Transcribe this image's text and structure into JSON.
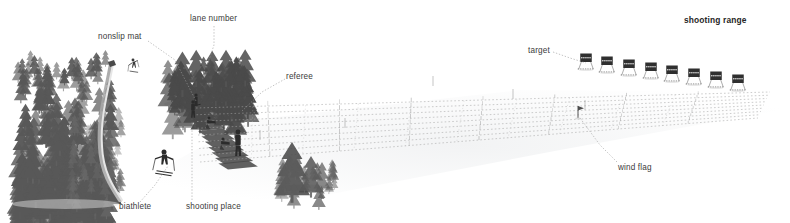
{
  "figure": {
    "domain": "diagram",
    "background_color": "#ffffff",
    "ink_color": "#3b3b3b",
    "title": "shooting range"
  },
  "labels": [
    {
      "id": "lane-number",
      "text": "lane number",
      "x": 190,
      "y": 15,
      "bold": false,
      "leader": [
        [
          214,
          26
        ],
        [
          214,
          45
        ],
        [
          208,
          63
        ]
      ]
    },
    {
      "id": "nonslip-mat",
      "text": "nonslip mat",
      "x": 98,
      "y": 33,
      "bold": false,
      "leader": [
        [
          148,
          41
        ],
        [
          175,
          60
        ],
        [
          196,
          101
        ]
      ]
    },
    {
      "id": "referee",
      "text": "referee",
      "x": 286,
      "y": 73,
      "bold": false,
      "leader": [
        [
          285,
          79
        ],
        [
          262,
          92
        ],
        [
          241,
          112
        ]
      ]
    },
    {
      "id": "target",
      "text": "target",
      "x": 528,
      "y": 47,
      "bold": false,
      "leader": [
        [
          553,
          52
        ],
        [
          570,
          58
        ],
        [
          586,
          63
        ]
      ]
    },
    {
      "id": "shooting-range",
      "text": "shooting range",
      "x": 684,
      "y": 16,
      "bold": true,
      "leader": []
    },
    {
      "id": "wind-flag",
      "text": "wind flag",
      "x": 618,
      "y": 164,
      "bold": false,
      "leader": [
        [
          617,
          162
        ],
        [
          600,
          145
        ],
        [
          580,
          118
        ]
      ]
    },
    {
      "id": "biathlete",
      "text": "biathlete",
      "x": 119,
      "y": 203,
      "bold": false,
      "leader": [
        [
          140,
          202
        ],
        [
          155,
          185
        ],
        [
          168,
          166
        ]
      ]
    },
    {
      "id": "shooting-place",
      "text": "shooting place",
      "x": 186,
      "y": 203,
      "bold": false,
      "leader": [
        [
          192,
          200
        ],
        [
          192,
          160
        ],
        [
          192,
          130
        ]
      ]
    }
  ],
  "scene_elements": {
    "forest_left": {
      "name": "dense conifer forest",
      "x": 18,
      "y": 50,
      "width": 95,
      "height": 150
    },
    "ski_track": {
      "name": "curving ski track",
      "from": [
        111,
        63
      ],
      "to": [
        122,
        200
      ]
    },
    "tree_cluster_center": {
      "name": "tree cluster behind shooting place",
      "x": 168,
      "y": 48,
      "width": 82,
      "height": 55
    },
    "spruce_cluster_front": {
      "name": "small spruce cluster",
      "x": 278,
      "y": 140,
      "width": 58,
      "height": 50
    },
    "skier_upper": {
      "name": "skier on track",
      "x": 133,
      "y": 60
    },
    "biathlete_front": {
      "name": "skiing biathlete",
      "x": 162,
      "y": 150
    },
    "referee_figure": {
      "name": "standing referee",
      "x": 237,
      "y": 133
    },
    "mat_count": 12,
    "lane_count": 8,
    "target_count": 8,
    "wind_flag_post": {
      "x": 578,
      "y": 118
    }
  },
  "targets": [
    {
      "n": 1,
      "x": 586,
      "y": 62
    },
    {
      "n": 2,
      "x": 607,
      "y": 65
    },
    {
      "n": 3,
      "x": 629,
      "y": 68
    },
    {
      "n": 4,
      "x": 651,
      "y": 71
    },
    {
      "n": 5,
      "x": 672,
      "y": 74
    },
    {
      "n": 6,
      "x": 694,
      "y": 77
    },
    {
      "n": 7,
      "x": 716,
      "y": 80
    },
    {
      "n": 8,
      "x": 738,
      "y": 83
    }
  ]
}
